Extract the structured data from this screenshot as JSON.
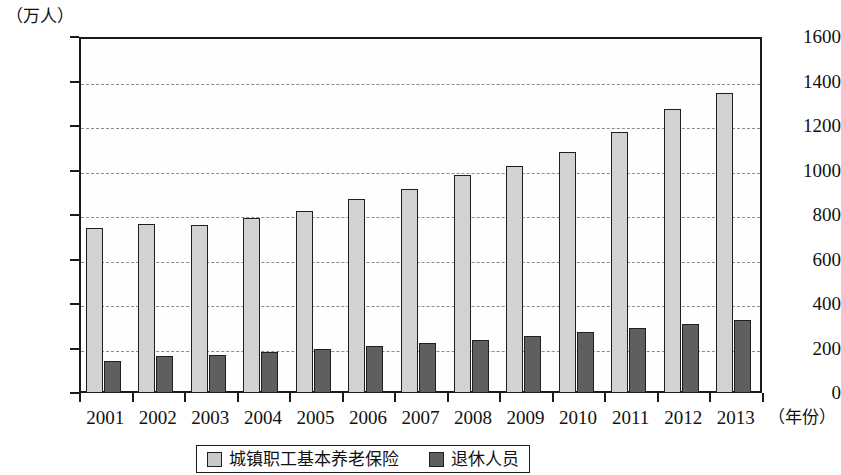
{
  "chart_data": {
    "type": "bar",
    "title": "",
    "subtitle": "",
    "xlabel": "（年份）",
    "ylabel": "（万人）",
    "unit_note": "（万人）",
    "categories": [
      "2001",
      "2002",
      "2003",
      "2004",
      "2005",
      "2006",
      "2007",
      "2008",
      "2009",
      "2010",
      "2011",
      "2012",
      "2013"
    ],
    "series": [
      {
        "name": "城镇职工基本养老保险",
        "color": "#d2d2d2",
        "values": [
          740,
          760,
          755,
          785,
          820,
          870,
          915,
          980,
          1020,
          1085,
          1175,
          1275,
          1350
        ]
      },
      {
        "name": "退休人员",
        "color": "#5f5f5f",
        "values": [
          145,
          165,
          170,
          185,
          198,
          210,
          225,
          240,
          257,
          272,
          290,
          308,
          327
        ]
      }
    ],
    "ylim": [
      0,
      1600
    ],
    "ytick_values": [
      0,
      200,
      400,
      600,
      800,
      1000,
      1200,
      1400,
      1600
    ],
    "ytick_labels": [
      "0",
      "200",
      "400",
      "600",
      "800",
      "1000",
      "1200",
      "1400",
      "1600"
    ],
    "grid": true,
    "grid_style": "dashed-horizontal",
    "legend_position": "bottom-center",
    "legend_entries": [
      "城镇职工基本养老保险",
      "退休人员"
    ]
  },
  "axis": {
    "unit_label": "（万人）",
    "x_axis_title": "（年份）"
  },
  "legend": {
    "items": [
      {
        "label": "城镇职工基本养老保险",
        "swatch": "light"
      },
      {
        "label": "退休人员",
        "swatch": "dark"
      }
    ]
  },
  "colors": {
    "series_light": "#d2d2d2",
    "series_dark": "#5f5f5f",
    "axis": "#1a1a1a",
    "grid": "#8c8c8c",
    "background": "#ffffff"
  }
}
